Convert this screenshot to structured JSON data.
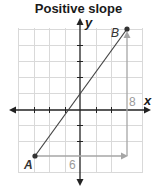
{
  "title": "Positive slope",
  "axes": {
    "x_label": "x",
    "y_label": "y"
  },
  "points": [
    {
      "name": "A",
      "label": "A"
    },
    {
      "name": "B",
      "label": "B"
    }
  ],
  "run_label": "6",
  "rise_label": "8",
  "colors": {
    "grid": "#d9d9d9",
    "axis": "#222222",
    "line": "#444444",
    "guide": "#a6a6a6",
    "guide_text": "#9a9a9a"
  }
}
